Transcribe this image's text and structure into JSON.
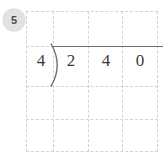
{
  "badge": {
    "label": "5",
    "shape": "circle",
    "fill_color": "#e2e2e2",
    "text_color": "#4c4c4c"
  },
  "grid": {
    "columns": 4,
    "rows": 4,
    "line_color": "#cfd3da",
    "line_style": "dashed",
    "left": 26,
    "top": 11,
    "width": 132,
    "height": 141,
    "v_positions": [
      0,
      27,
      62,
      96,
      131
    ],
    "h_positions": [
      0,
      35,
      75,
      108,
      140
    ]
  },
  "division": {
    "type": "long-division",
    "divisor": "4",
    "dividend_digits": [
      "2",
      "4",
      "0"
    ],
    "dividend": "240",
    "quotient_digits": [],
    "bracket_glyph": ")",
    "vinculum_color": "#6e6e6e",
    "digit_color": "#3b3b3b",
    "digit_positions": {
      "divisor_x": 32,
      "dividend_x": [
        62,
        97,
        131
      ],
      "baseline_y": 60
    }
  }
}
